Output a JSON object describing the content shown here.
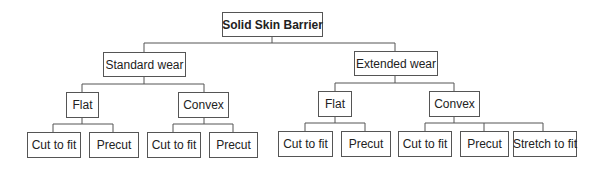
{
  "diagram": {
    "type": "tree",
    "root": {
      "label": "Solid Skin Barrier",
      "children": [
        {
          "label": "Standard wear",
          "children": [
            {
              "label": "Flat",
              "children": [
                {
                  "label": "Cut to fit"
                },
                {
                  "label": "Precut"
                }
              ]
            },
            {
              "label": "Convex",
              "children": [
                {
                  "label": "Cut to fit"
                },
                {
                  "label": "Precut"
                }
              ]
            }
          ]
        },
        {
          "label": "Extended wear",
          "children": [
            {
              "label": "Flat",
              "children": [
                {
                  "label": "Cut to fit"
                },
                {
                  "label": "Precut"
                }
              ]
            },
            {
              "label": "Convex",
              "children": [
                {
                  "label": "Cut to fit"
                },
                {
                  "label": "Precut"
                },
                {
                  "label": "Stretch to fit"
                }
              ]
            }
          ]
        }
      ]
    }
  },
  "colors": {
    "border": "#555555",
    "background": "#ffffff",
    "text": "#222222"
  }
}
